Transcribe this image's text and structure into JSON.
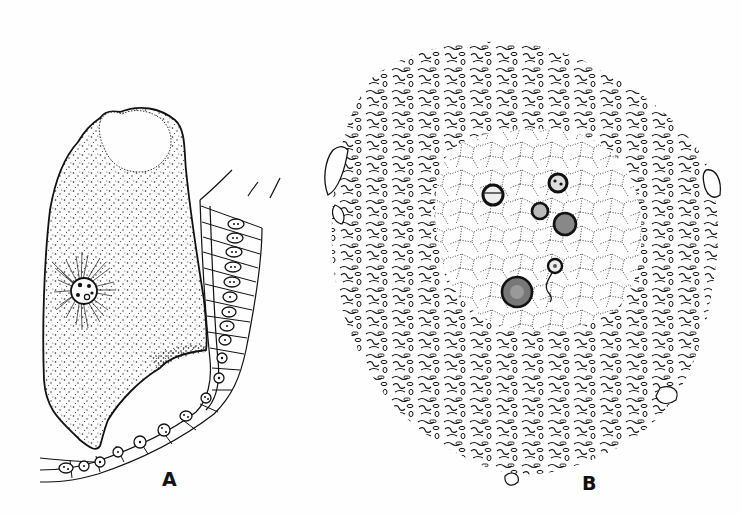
{
  "figure": {
    "panels": [
      {
        "id": "A",
        "label": "A",
        "description": "Large stippled cell with radiating fibrillar nucleus region, adjacent to a curved tubule lined with epithelial cells"
      },
      {
        "id": "B",
        "label": "B",
        "description": "Rounded cell with dense peripheral squiggly bodies and a dotted reticular center containing six dark nucleolar bodies"
      }
    ],
    "colors": {
      "ink": "#111111",
      "background": "#fefefe"
    }
  }
}
